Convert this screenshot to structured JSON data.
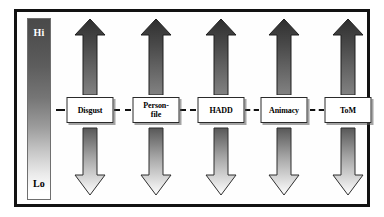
{
  "figure": {
    "type": "flow-diagram",
    "orientation": "horizontal",
    "frame_color": "#121212",
    "background": "#ffffff"
  },
  "scale": {
    "name": "cognitive-complexity-scale",
    "top_label": "Hi",
    "bottom_label": "Lo",
    "top_color": "#4a4a4a",
    "bottom_color": "#ffffff",
    "top_label_color": "#ffffff",
    "bottom_label_color": "#000000"
  },
  "arrows": {
    "up": {
      "name": "upward-arrow",
      "direction": "up",
      "gradient_from": "#333333",
      "gradient_to": "#7d7d7d",
      "count": 5
    },
    "down": {
      "name": "downward-arrow",
      "direction": "down",
      "gradient_from": "#5a5a5a",
      "gradient_to": "#ffffff",
      "outline": "#2e2e2e",
      "count": 5
    }
  },
  "nodes": [
    {
      "id": "disgust",
      "label": "Disgust",
      "order": 1
    },
    {
      "id": "personfile",
      "label": "Person-\nfile",
      "order": 2
    },
    {
      "id": "hadd",
      "label": "HADD",
      "order": 3
    },
    {
      "id": "animacy",
      "label": "Animacy",
      "order": 4
    },
    {
      "id": "tom",
      "label": "ToM",
      "order": 5
    }
  ],
  "connectors": {
    "style": "dashed",
    "color": "#111111",
    "segments": [
      "lead-in",
      "disgust-to-personfile",
      "personfile-to-hadd",
      "hadd-to-animacy",
      "animacy-to-tom",
      "lead-out"
    ]
  }
}
